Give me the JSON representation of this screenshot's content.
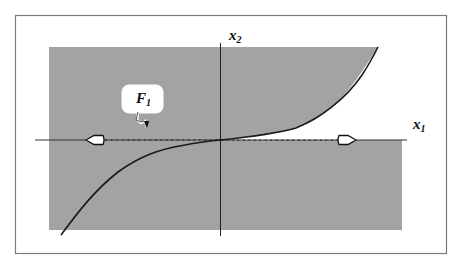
{
  "diagram": {
    "colors": {
      "frame": "#7a7a7a",
      "region_fill": "#a3a3a3",
      "axis": "#222222",
      "curve": "#1a1a1a",
      "background": "#ffffff",
      "callout_fill": "#ffffff"
    },
    "axes": {
      "x_label": {
        "base": "x",
        "sub": "1"
      },
      "y_label": {
        "base": "x",
        "sub": "2"
      }
    },
    "callout": {
      "label": {
        "base": "F",
        "sub": "1"
      }
    },
    "arrows": [
      {
        "position": "left-on-x-axis",
        "direction": "left"
      },
      {
        "position": "right-on-x-axis",
        "direction": "right"
      }
    ],
    "shaded_region": "Gray rectangle excluding the area between the cubic-like curve and the positive x1 axis (first quadrant below curve)",
    "curve": "Cubic-shaped curve through the origin, flat near origin, rising steeply in first quadrant and falling in third quadrant"
  }
}
